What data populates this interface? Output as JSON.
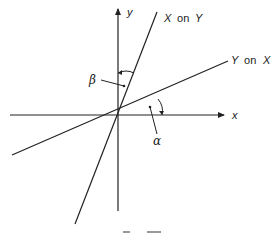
{
  "diagram": {
    "type": "regression-lines",
    "axes": {
      "x_label": "x",
      "y_label": "y"
    },
    "lines": [
      {
        "id": "x-on-y",
        "label_var1": "X",
        "label_word": "on",
        "label_var2": "Y"
      },
      {
        "id": "y-on-x",
        "label_var1": "Y",
        "label_word": "on",
        "label_var2": "X"
      }
    ],
    "angles": {
      "alpha": "α",
      "beta": "β"
    },
    "caption": "Fig. 7.X (clipped)"
  },
  "colors": {
    "line": "#222222",
    "background": "#ffffff"
  }
}
